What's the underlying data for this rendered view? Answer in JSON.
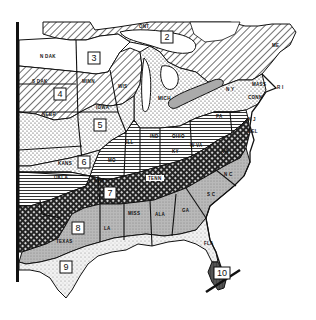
{
  "map": {
    "type": "zone map",
    "description": "Black-and-white hatched zone map of the eastern United States",
    "zones": [
      {
        "id": "2",
        "label": "2",
        "x": 167,
        "y": 38,
        "pattern": "diagonal-hatch"
      },
      {
        "id": "3",
        "label": "3",
        "x": 94,
        "y": 58,
        "pattern": "plain"
      },
      {
        "id": "4",
        "label": "4",
        "x": 60,
        "y": 94,
        "pattern": "diagonal-hatch"
      },
      {
        "id": "5",
        "label": "5",
        "x": 100,
        "y": 125,
        "pattern": "dots"
      },
      {
        "id": "6",
        "label": "6",
        "x": 84,
        "y": 162,
        "pattern": "dots"
      },
      {
        "id": "7",
        "label": "7",
        "x": 110,
        "y": 193,
        "pattern": "crosshatch"
      },
      {
        "id": "8",
        "label": "8",
        "x": 78,
        "y": 228,
        "pattern": "gray-stipple"
      },
      {
        "id": "9",
        "label": "9",
        "x": 66,
        "y": 267,
        "pattern": "light-stipple"
      },
      {
        "id": "10",
        "label": "10",
        "x": 222,
        "y": 273,
        "pattern": "dark-gray"
      }
    ],
    "state_labels": [
      {
        "text": "ONT",
        "x": 143,
        "y": 27
      },
      {
        "text": "N DAK",
        "x": 50,
        "y": 57
      },
      {
        "text": "S DAK",
        "x": 42,
        "y": 82
      },
      {
        "text": "MINN",
        "x": 88,
        "y": 82
      },
      {
        "text": "WIS",
        "x": 124,
        "y": 87
      },
      {
        "text": "NEBR",
        "x": 50,
        "y": 115
      },
      {
        "text": "IOWA",
        "x": 102,
        "y": 108
      },
      {
        "text": "MICH",
        "x": 166,
        "y": 100
      },
      {
        "text": "ILL",
        "x": 130,
        "y": 143
      },
      {
        "text": "IND",
        "x": 155,
        "y": 137
      },
      {
        "text": "OHIO",
        "x": 178,
        "y": 137
      },
      {
        "text": "PA",
        "x": 220,
        "y": 117
      },
      {
        "text": "N Y",
        "x": 230,
        "y": 90
      },
      {
        "text": "MASS",
        "x": 260,
        "y": 85
      },
      {
        "text": "CONN",
        "x": 254,
        "y": 98
      },
      {
        "text": "R I",
        "x": 277,
        "y": 88
      },
      {
        "text": "ME",
        "x": 275,
        "y": 46
      },
      {
        "text": "N J",
        "x": 248,
        "y": 120
      },
      {
        "text": "DEL",
        "x": 252,
        "y": 132
      },
      {
        "text": "KY",
        "x": 176,
        "y": 152
      },
      {
        "text": "W VA",
        "x": 196,
        "y": 146
      },
      {
        "text": "VA",
        "x": 225,
        "y": 152
      },
      {
        "text": "KANS",
        "x": 66,
        "y": 164
      },
      {
        "text": "MO",
        "x": 112,
        "y": 161
      },
      {
        "text": "OKLA",
        "x": 60,
        "y": 178
      },
      {
        "text": "ARK",
        "x": 100,
        "y": 181
      },
      {
        "text": "TENN",
        "x": 155,
        "y": 179
      },
      {
        "text": "N C",
        "x": 228,
        "y": 175
      },
      {
        "text": "S C",
        "x": 211,
        "y": 195
      },
      {
        "text": "MISS",
        "x": 134,
        "y": 214
      },
      {
        "text": "ALA",
        "x": 160,
        "y": 215
      },
      {
        "text": "GA",
        "x": 186,
        "y": 211
      },
      {
        "text": "LA",
        "x": 108,
        "y": 229
      },
      {
        "text": "TEXAS",
        "x": 62,
        "y": 242
      },
      {
        "text": "FLA",
        "x": 209,
        "y": 244
      }
    ]
  }
}
